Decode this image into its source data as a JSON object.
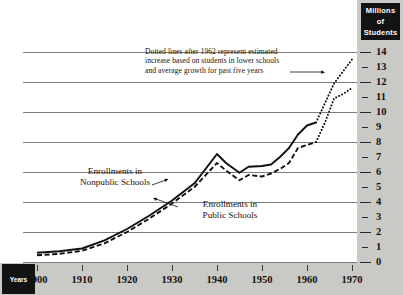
{
  "figure": {
    "units_box_label": "Millions\nof\nStudents",
    "units_line1": "Millions",
    "units_line2": "of",
    "units_line3": "Students",
    "years_box_label": "Years"
  },
  "annotations": {
    "estimate_note_line1": "Dotted lines after 1962 represent estimated",
    "estimate_note_line2": "increase based on students in lower schools",
    "estimate_note_line3": "and average growth for past five years",
    "nonpublic_label_line1": "Enrollments in",
    "nonpublic_label_line2": "Nonpublic Schools",
    "public_label_line1": "Enrollments in",
    "public_label_line2": "Public Schools"
  },
  "colors": {
    "strip_background": "#c9c9c6",
    "box_background": "#131313",
    "box_text": "#ffffff",
    "gridline": "#7d7d7d",
    "series_line": "#11100f",
    "page_background": "#ffffff"
  },
  "chart_data": {
    "type": "line",
    "title": "",
    "xlabel": "Years",
    "ylabel": "Millions of Students",
    "xlim": [
      1900,
      1970
    ],
    "ylim": [
      0,
      14
    ],
    "grid": true,
    "grid_values": [
      0,
      2,
      4,
      6,
      8,
      10,
      12,
      14
    ],
    "ytick_labels": [
      "0",
      "1",
      "2",
      "3",
      "4",
      "5",
      "6",
      "7",
      "8",
      "9",
      "10",
      "11",
      "12",
      "13",
      "14"
    ],
    "xtick_labels": [
      "1900",
      "1910",
      "1920",
      "1930",
      "1940",
      "1950",
      "1960",
      "1970"
    ],
    "legend_position": "inline-annotations",
    "estimate_starts_year": 1962,
    "series": [
      {
        "name": "Enrollments in Nonpublic Schools",
        "style": "solid",
        "estimated_style": "dotted",
        "x": [
          1900,
          1905,
          1910,
          1915,
          1920,
          1925,
          1930,
          1935,
          1940,
          1942,
          1945,
          1947,
          1950,
          1952,
          1954,
          1956,
          1958,
          1960,
          1962,
          1964,
          1966,
          1968,
          1970
        ],
        "values": [
          0.62,
          0.72,
          0.9,
          1.45,
          2.2,
          3.1,
          4.1,
          5.25,
          7.2,
          6.6,
          5.95,
          6.35,
          6.4,
          6.5,
          7.0,
          7.6,
          8.5,
          9.1,
          9.3,
          10.6,
          11.9,
          12.7,
          13.5
        ]
      },
      {
        "name": "Enrollments in Public Schools",
        "style": "dashed",
        "estimated_style": "dotted",
        "x": [
          1900,
          1905,
          1910,
          1915,
          1920,
          1925,
          1930,
          1935,
          1940,
          1942,
          1945,
          1947,
          1950,
          1952,
          1954,
          1956,
          1958,
          1960,
          1962,
          1964,
          1966,
          1968,
          1970
        ],
        "values": [
          0.45,
          0.55,
          0.75,
          1.25,
          2.0,
          2.9,
          3.9,
          5.0,
          6.6,
          6.1,
          5.45,
          5.8,
          5.7,
          5.9,
          6.2,
          6.6,
          7.6,
          7.8,
          8.0,
          9.3,
          10.9,
          11.2,
          11.6
        ]
      }
    ]
  }
}
